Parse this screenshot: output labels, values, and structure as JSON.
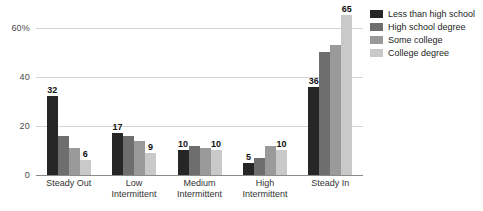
{
  "chart_data": {
    "type": "bar",
    "title": "",
    "subtitle": "",
    "xlabel": "",
    "ylabel": "",
    "ylim": [
      0,
      68
    ],
    "grid": true,
    "legend_position": "right",
    "categories": [
      "Steady Out",
      "Low Intermittent",
      "Medium Intermittent",
      "High Intermittent",
      "Steady In"
    ],
    "category_lines": [
      [
        "Steady Out"
      ],
      [
        "Low",
        "Intermittent"
      ],
      [
        "Medium",
        "Intermittent"
      ],
      [
        "High",
        "Intermittent"
      ],
      [
        "Steady In"
      ]
    ],
    "yticks": [
      {
        "value": 0,
        "label": "0"
      },
      {
        "value": 20,
        "label": "20"
      },
      {
        "value": 40,
        "label": "40"
      },
      {
        "value": 60,
        "label": "60%"
      }
    ],
    "series": [
      {
        "name": "Less than high school",
        "color": "#262626",
        "values": [
          32,
          17,
          10,
          5,
          36
        ],
        "labels": [
          "32",
          "17",
          "10",
          "5",
          "36"
        ]
      },
      {
        "name": "High school degree",
        "color": "#6e6e6e",
        "values": [
          16,
          16,
          12,
          7,
          50
        ],
        "labels": [
          "",
          "",
          "",
          "",
          ""
        ]
      },
      {
        "name": "Some college",
        "color": "#9a9a9a",
        "values": [
          11,
          14,
          11,
          12,
          53
        ],
        "labels": [
          "",
          "",
          "",
          "",
          ""
        ]
      },
      {
        "name": "College degree",
        "color": "#c9c9c9",
        "values": [
          6,
          9,
          10,
          10,
          65
        ],
        "labels": [
          "6",
          "9",
          "10",
          "10",
          "65"
        ]
      }
    ]
  },
  "colors": {
    "background": "#ffffff",
    "gridline": "#d4d4d4",
    "axis": "#8a8a8a",
    "tick_text": "#4a4a4a",
    "label_text": "#111111"
  }
}
